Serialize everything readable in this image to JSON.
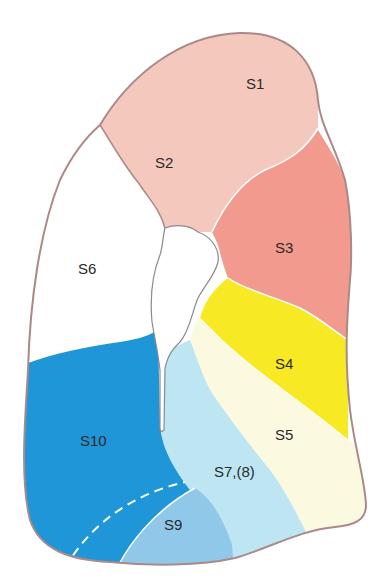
{
  "diagram": {
    "type": "lung-segment-map",
    "segments": [
      {
        "id": "S1",
        "label": "S1",
        "color": "#f5c8bd"
      },
      {
        "id": "S2",
        "label": "S2",
        "color": "#f5c8bd"
      },
      {
        "id": "S3",
        "label": "S3",
        "color": "#f29a8e"
      },
      {
        "id": "S4",
        "label": "S4",
        "color": "#f7ea24"
      },
      {
        "id": "S5",
        "label": "S5",
        "color": "#fcf9e1"
      },
      {
        "id": "S6",
        "label": "S6",
        "color": "#ffffff"
      },
      {
        "id": "S7",
        "label": "S7,(8)",
        "color": "#bde5f2"
      },
      {
        "id": "S9",
        "label": "S9",
        "color": "#90c8ea"
      },
      {
        "id": "S10",
        "label": "S10",
        "color": "#1f96d7"
      }
    ],
    "outline_color": "#a98a88",
    "boundary_color": "#ffffff"
  }
}
